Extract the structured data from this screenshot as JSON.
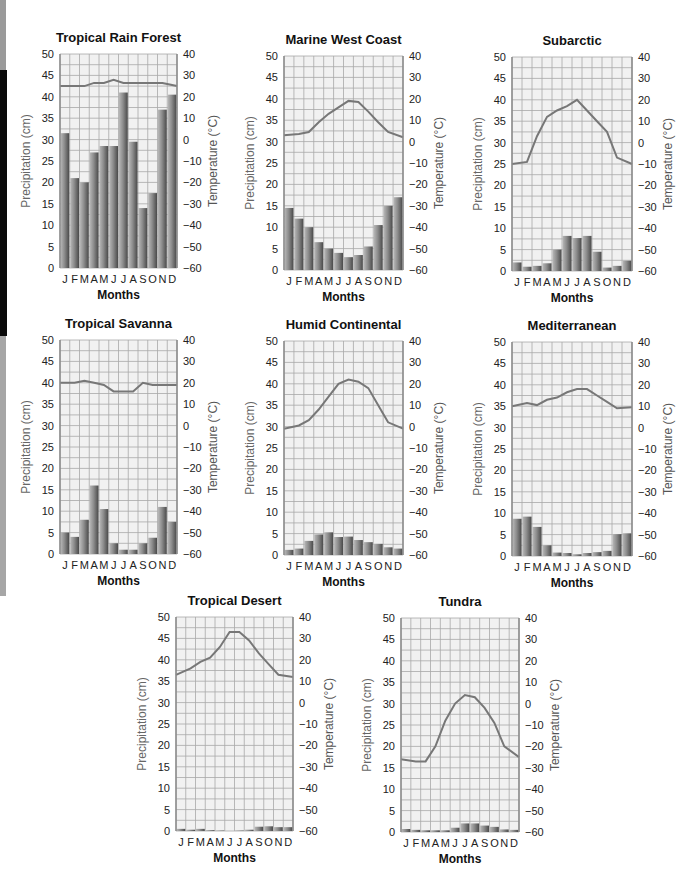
{
  "figure": {
    "month_letters": [
      "J",
      "F",
      "M",
      "A",
      "M",
      "J",
      "J",
      "A",
      "S",
      "O",
      "N",
      "D"
    ],
    "xlabel": "Months",
    "ylabel_left": "Precipitation (cm)",
    "ylabel_right": "Temperature (°C)"
  },
  "chart_data": [
    {
      "type": "bar",
      "title": "Tropical Rain Forest",
      "categories": [
        "J",
        "F",
        "M",
        "A",
        "M",
        "J",
        "J",
        "A",
        "S",
        "O",
        "N",
        "D"
      ],
      "series": [
        {
          "name": "Precipitation (cm)",
          "axis": "left",
          "kind": "bar",
          "values": [
            31.5,
            21,
            20,
            27,
            28.5,
            28.5,
            41,
            29.5,
            14,
            17.5,
            37,
            40.5
          ]
        },
        {
          "name": "Temperature (°C)",
          "axis": "right",
          "kind": "line",
          "values": [
            25,
            25,
            25,
            26.5,
            26.5,
            28,
            26.5,
            26.5,
            26.5,
            26.5,
            26.5,
            25
          ]
        }
      ],
      "xlabel": "Months",
      "ylabel": "Precipitation (cm)",
      "ylabel_right": "Temperature (°C)",
      "ylim": [
        0,
        50
      ],
      "ylim_right": [
        -60,
        40
      ],
      "yticks": [
        0,
        5,
        10,
        15,
        20,
        25,
        30,
        35,
        40,
        45,
        50
      ],
      "yticks_right": [
        -60,
        -50,
        -40,
        -30,
        -20,
        -10,
        0,
        10,
        20,
        30,
        40
      ],
      "grid": true
    },
    {
      "type": "bar",
      "title": "Marine West Coast",
      "categories": [
        "J",
        "F",
        "M",
        "A",
        "M",
        "J",
        "J",
        "A",
        "S",
        "O",
        "N",
        "D"
      ],
      "series": [
        {
          "name": "Precipitation (cm)",
          "axis": "left",
          "kind": "bar",
          "values": [
            14.5,
            12,
            10,
            6.5,
            5,
            4,
            3,
            3.5,
            5.5,
            10.5,
            15,
            17
          ]
        },
        {
          "name": "Temperature (°C)",
          "axis": "right",
          "kind": "line",
          "values": [
            3,
            3.5,
            4.5,
            9,
            13,
            16,
            19,
            18.5,
            14,
            9,
            4.5,
            2
          ]
        }
      ],
      "xlabel": "Months",
      "ylabel": "Precipitation (cm)",
      "ylabel_right": "Temperature (°C)",
      "ylim": [
        0,
        50
      ],
      "ylim_right": [
        -60,
        40
      ],
      "yticks": [
        0,
        5,
        10,
        15,
        20,
        25,
        30,
        35,
        40,
        45,
        50
      ],
      "yticks_right": [
        -60,
        -50,
        -40,
        -30,
        -20,
        -10,
        0,
        10,
        20,
        30,
        40
      ],
      "grid": true
    },
    {
      "type": "bar",
      "title": "Subarctic",
      "categories": [
        "J",
        "F",
        "M",
        "A",
        "M",
        "J",
        "J",
        "A",
        "S",
        "O",
        "N",
        "D"
      ],
      "series": [
        {
          "name": "Precipitation (cm)",
          "axis": "left",
          "kind": "bar",
          "values": [
            2,
            1,
            1.2,
            1.8,
            5,
            8.2,
            7.7,
            8.2,
            4.5,
            0.8,
            1.2,
            2.4
          ]
        },
        {
          "name": "Temperature (°C)",
          "axis": "right",
          "kind": "line",
          "values": [
            -10,
            -9,
            3,
            12,
            15,
            17,
            20,
            15,
            10,
            5,
            -7,
            -10
          ]
        }
      ],
      "xlabel": "Months",
      "ylabel": "Precipitation (cm)",
      "ylabel_right": "Temperature (°C)",
      "ylim": [
        0,
        50
      ],
      "ylim_right": [
        -60,
        40
      ],
      "yticks": [
        0,
        5,
        10,
        15,
        20,
        25,
        30,
        35,
        40,
        45,
        50
      ],
      "yticks_right": [
        -60,
        -50,
        -40,
        -30,
        -20,
        -10,
        0,
        10,
        20,
        30,
        40
      ],
      "grid": true
    },
    {
      "type": "bar",
      "title": "Tropical Savanna",
      "categories": [
        "J",
        "F",
        "M",
        "A",
        "M",
        "J",
        "J",
        "A",
        "S",
        "O",
        "N",
        "D"
      ],
      "series": [
        {
          "name": "Precipitation (cm)",
          "axis": "left",
          "kind": "bar",
          "values": [
            5,
            4,
            8,
            16,
            10.5,
            2.5,
            1,
            1,
            2.5,
            3.8,
            11,
            7.5
          ]
        },
        {
          "name": "Temperature (°C)",
          "axis": "right",
          "kind": "line",
          "values": [
            20,
            20,
            21,
            20,
            19,
            16,
            16,
            16,
            20,
            19,
            19,
            19
          ]
        }
      ],
      "xlabel": "Months",
      "ylabel": "Precipitation (cm)",
      "ylabel_right": "Temperature (°C)",
      "ylim": [
        0,
        50
      ],
      "ylim_right": [
        -60,
        40
      ],
      "yticks": [
        0,
        5,
        10,
        15,
        20,
        25,
        30,
        35,
        40,
        45,
        50
      ],
      "yticks_right": [
        -60,
        -50,
        -40,
        -30,
        -20,
        -10,
        0,
        10,
        20,
        30,
        40
      ],
      "grid": true
    },
    {
      "type": "bar",
      "title": "Humid Continental",
      "categories": [
        "J",
        "F",
        "M",
        "A",
        "M",
        "J",
        "J",
        "A",
        "S",
        "O",
        "N",
        "D"
      ],
      "series": [
        {
          "name": "Precipitation (cm)",
          "axis": "left",
          "kind": "bar",
          "values": [
            1.2,
            1.5,
            3.3,
            4.8,
            5.3,
            4.2,
            4.3,
            3.5,
            3,
            2.6,
            1.8,
            1.5
          ]
        },
        {
          "name": "Temperature (°C)",
          "axis": "right",
          "kind": "line",
          "values": [
            -1,
            0.5,
            3,
            8,
            14,
            20,
            22,
            21,
            18,
            10,
            2,
            -1
          ]
        }
      ],
      "xlabel": "Months",
      "ylabel": "Precipitation (cm)",
      "ylabel_right": "Temperature (°C)",
      "ylim": [
        0,
        50
      ],
      "ylim_right": [
        -60,
        40
      ],
      "yticks": [
        0,
        5,
        10,
        15,
        20,
        25,
        30,
        35,
        40,
        45,
        50
      ],
      "yticks_right": [
        -60,
        -50,
        -40,
        -30,
        -20,
        -10,
        0,
        10,
        20,
        30,
        40
      ],
      "grid": true
    },
    {
      "type": "bar",
      "title": "Mediterranean",
      "categories": [
        "J",
        "F",
        "M",
        "A",
        "M",
        "J",
        "J",
        "A",
        "S",
        "O",
        "N",
        "D"
      ],
      "series": [
        {
          "name": "Precipitation (cm)",
          "axis": "left",
          "kind": "bar",
          "values": [
            8.7,
            9.2,
            6.8,
            2.5,
            0.8,
            0.7,
            0.4,
            0.7,
            0.9,
            1.2,
            5.1,
            5.3
          ]
        },
        {
          "name": "Temperature (°C)",
          "axis": "right",
          "kind": "line",
          "values": [
            10,
            11.5,
            10.5,
            13,
            14,
            16.5,
            18,
            18,
            15,
            12,
            9,
            9.5
          ]
        }
      ],
      "xlabel": "Months",
      "ylabel": "Precipitation (cm)",
      "ylabel_right": "Temperature (°C)",
      "ylim": [
        0,
        50
      ],
      "ylim_right": [
        -60,
        40
      ],
      "yticks": [
        0,
        5,
        10,
        15,
        20,
        25,
        30,
        35,
        40,
        45,
        50
      ],
      "yticks_right": [
        -60,
        -50,
        -40,
        -30,
        -20,
        -10,
        0,
        10,
        20,
        30,
        40
      ],
      "grid": true
    },
    {
      "type": "bar",
      "title": "Tropical Desert",
      "categories": [
        "J",
        "F",
        "M",
        "A",
        "M",
        "J",
        "J",
        "A",
        "S",
        "O",
        "N",
        "D"
      ],
      "series": [
        {
          "name": "Precipitation (cm)",
          "axis": "left",
          "kind": "bar",
          "values": [
            0.5,
            0.3,
            0.5,
            0.2,
            0.1,
            0,
            0.1,
            0.3,
            1,
            1.1,
            0.9,
            0.9
          ]
        },
        {
          "name": "Temperature (°C)",
          "axis": "right",
          "kind": "line",
          "values": [
            13,
            16,
            19,
            21,
            26,
            33,
            33,
            29,
            23,
            18,
            13,
            12
          ]
        }
      ],
      "xlabel": "Months",
      "ylabel": "Precipitation (cm)",
      "ylabel_right": "Temperature (°C)",
      "ylim": [
        0,
        50
      ],
      "ylim_right": [
        -60,
        40
      ],
      "yticks": [
        0,
        5,
        10,
        15,
        20,
        25,
        30,
        35,
        40,
        45,
        50
      ],
      "yticks_right": [
        -60,
        -50,
        -40,
        -30,
        -20,
        -10,
        0,
        10,
        20,
        30,
        40
      ],
      "grid": true
    },
    {
      "type": "bar",
      "title": "Tundra",
      "categories": [
        "J",
        "F",
        "M",
        "A",
        "M",
        "J",
        "J",
        "A",
        "S",
        "O",
        "N",
        "D"
      ],
      "series": [
        {
          "name": "Precipitation (cm)",
          "axis": "left",
          "kind": "bar",
          "values": [
            0.7,
            0.5,
            0.4,
            0.4,
            0.4,
            1,
            2,
            2,
            1.5,
            1.2,
            0.6,
            0.5
          ]
        },
        {
          "name": "Temperature (°C)",
          "axis": "right",
          "kind": "line",
          "values": [
            -26,
            -27,
            -27,
            -20,
            -8,
            0,
            4,
            3,
            -2,
            -9,
            -20,
            -25
          ]
        }
      ],
      "xlabel": "Months",
      "ylabel": "Precipitation (cm)",
      "ylabel_right": "Temperature (°C)",
      "ylim": [
        0,
        50
      ],
      "ylim_right": [
        -60,
        40
      ],
      "yticks": [
        0,
        5,
        10,
        15,
        20,
        25,
        30,
        35,
        40,
        45,
        50
      ],
      "yticks_right": [
        -60,
        -50,
        -40,
        -30,
        -20,
        -10,
        0,
        10,
        20,
        30,
        40
      ],
      "grid": true
    }
  ],
  "colors": {
    "plot_bg": "#f1f1f1",
    "grid": "#a8a8a8",
    "axis": "#8a8a8a",
    "bar_light": "#b8b8b8",
    "bar_dark": "#4a4a4a",
    "line": "#777777",
    "left_label": "#6a6a6a"
  }
}
